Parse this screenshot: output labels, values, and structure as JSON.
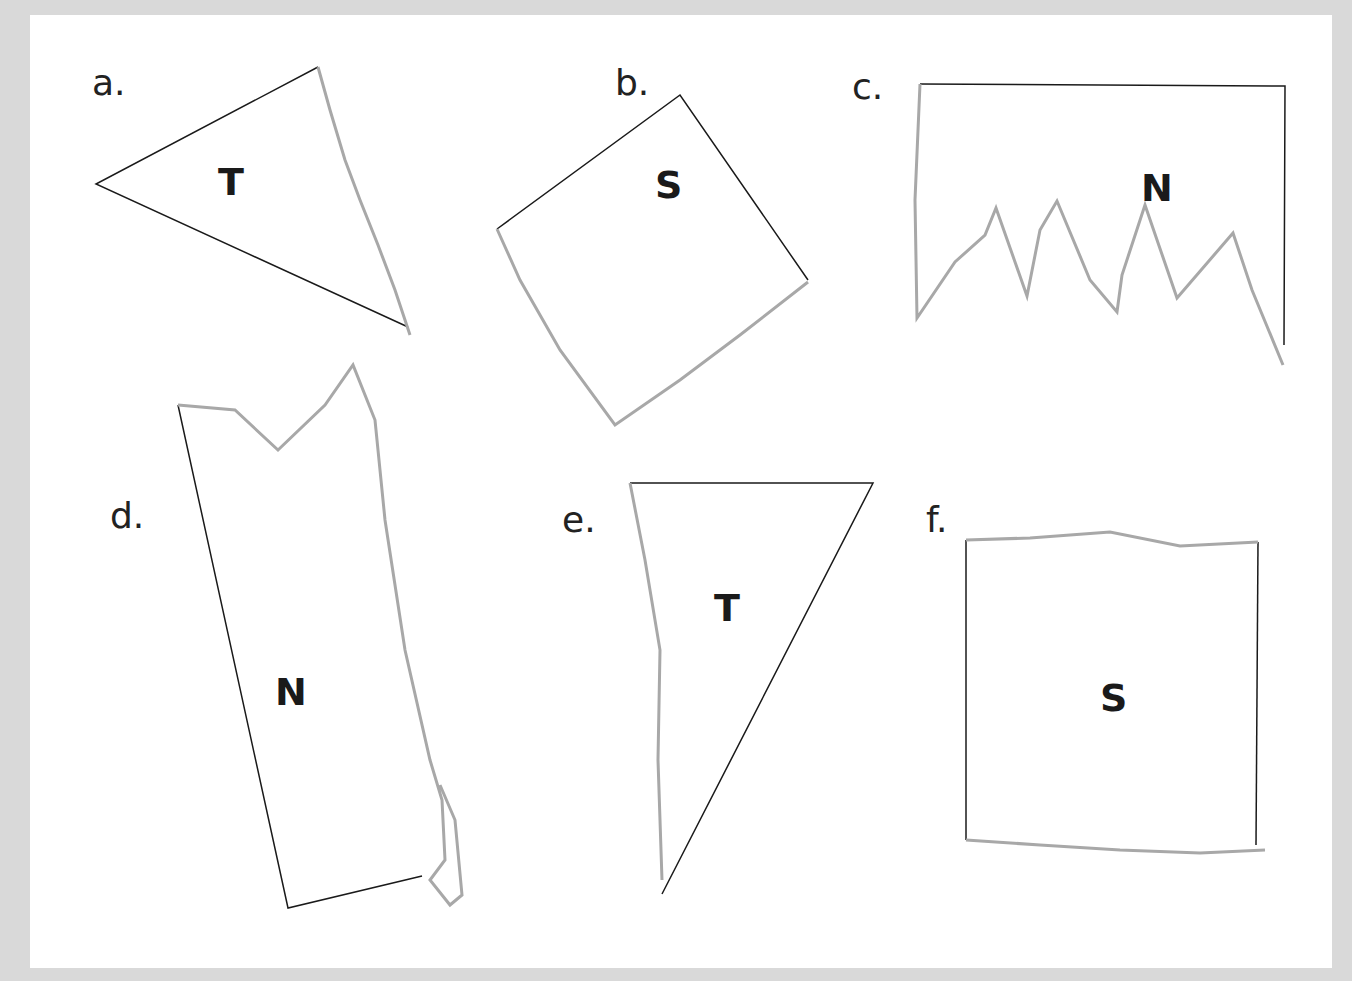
{
  "figure": {
    "background_color": "#d9d9d9",
    "card_color": "#ffffff",
    "straight_edge_color": "#1a1a1a",
    "torn_edge_color": "#a8a8a8"
  },
  "shapes": [
    {
      "label": "a.",
      "letter": "T"
    },
    {
      "label": "b.",
      "letter": "S"
    },
    {
      "label": "c.",
      "letter": "N"
    },
    {
      "label": "d.",
      "letter": "N"
    },
    {
      "label": "e.",
      "letter": "T"
    },
    {
      "label": "f.",
      "letter": "S"
    }
  ]
}
